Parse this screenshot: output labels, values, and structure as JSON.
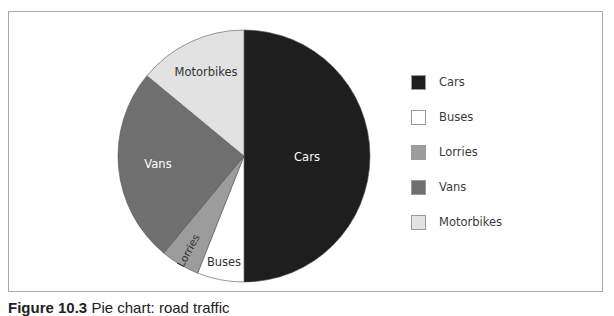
{
  "chart_data": {
    "type": "pie",
    "title": "",
    "categories": [
      "Cars",
      "Buses",
      "Lorries",
      "Vans",
      "Motorbikes"
    ],
    "values": [
      50,
      6,
      5,
      25,
      14
    ],
    "unit": "percent (estimated from slice angles)",
    "colors": [
      "#1e1e1e",
      "#ffffff",
      "#9c9c9c",
      "#6f6f6f",
      "#e2e2e2"
    ],
    "start_angle_deg": 0,
    "direction": "clockwise",
    "slice_labels": [
      "Cars",
      "Buses",
      "Lorries",
      "Vans",
      "Motorbikes"
    ],
    "legend": {
      "position": "right",
      "entries": [
        "Cars",
        "Buses",
        "Lorries",
        "Vans",
        "Motorbikes"
      ]
    }
  },
  "caption": {
    "number": "Figure 10.3",
    "text": "Pie chart: road traffic"
  }
}
